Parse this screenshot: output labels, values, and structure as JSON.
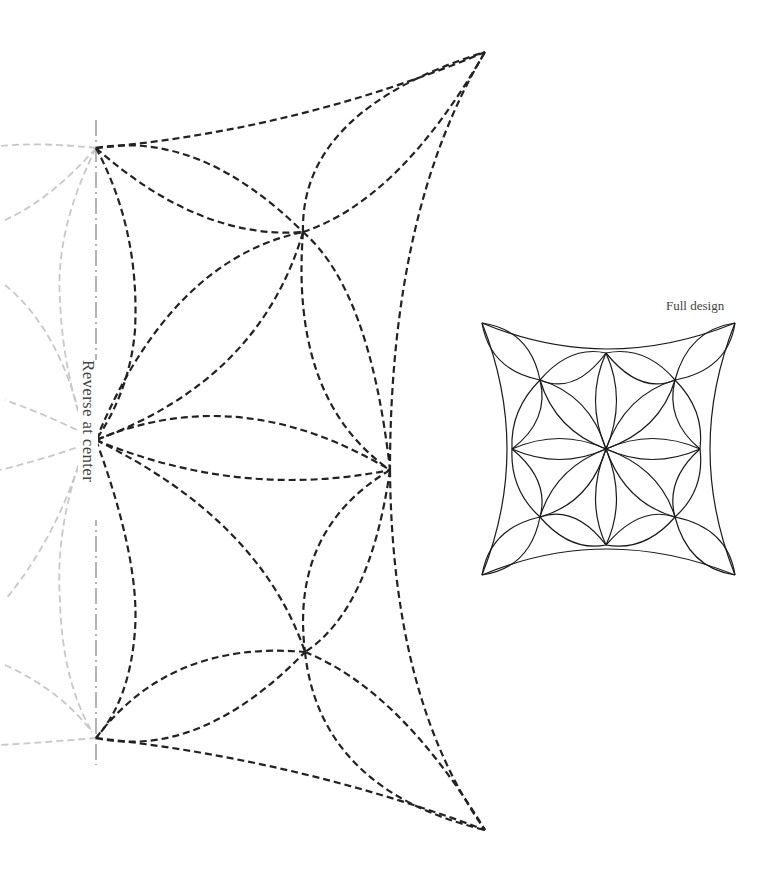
{
  "labels": {
    "reverse_at_center": "Reverse at center",
    "full_design": "Full design"
  },
  "colors": {
    "dashed_stroke": "#222222",
    "ghost_stroke": "#c8c8c8",
    "axis_stroke": "#777777",
    "full_design_stroke": "#1a1a1a",
    "background": "#ffffff"
  },
  "half_pattern": {
    "style": "dashed",
    "key_points": {
      "left_top": [
        96,
        148
      ],
      "left_center": [
        96,
        440
      ],
      "left_bottom": [
        96,
        738
      ],
      "top_tip": [
        485,
        52
      ],
      "bottom_tip": [
        485,
        830
      ],
      "upper_crossing": [
        303,
        232
      ],
      "right_center": [
        390,
        470
      ],
      "lower_crossing": [
        305,
        652
      ]
    }
  },
  "full_design": {
    "style": "solid",
    "corners": [
      [
        482,
        323
      ],
      [
        735,
        323
      ],
      [
        735,
        575
      ],
      [
        482,
        575
      ]
    ],
    "center": [
      606,
      449
    ]
  }
}
